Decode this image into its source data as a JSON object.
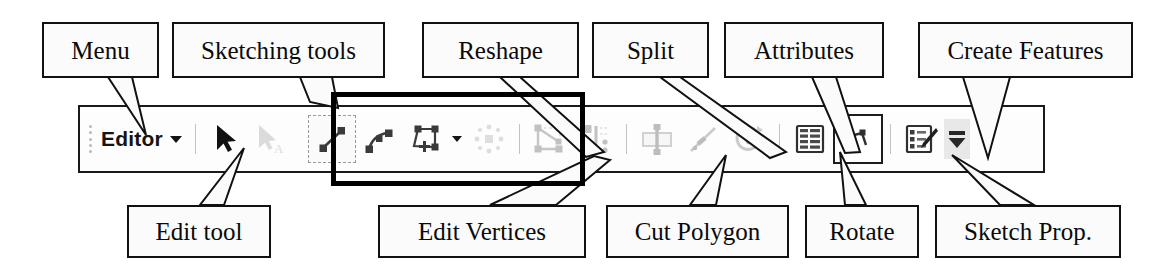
{
  "figure": {
    "annotation_style": "callout boxes with leader lines"
  },
  "callouts_top": [
    {
      "id": "menu",
      "label": "Menu",
      "x": 42,
      "y": 22,
      "w": 117,
      "h": 56,
      "font": 25
    },
    {
      "id": "sketching-tools",
      "label": "Sketching tools",
      "x": 172,
      "y": 22,
      "w": 213,
      "h": 56,
      "font": 25
    },
    {
      "id": "reshape",
      "label": "Reshape",
      "x": 422,
      "y": 22,
      "w": 157,
      "h": 56,
      "font": 25
    },
    {
      "id": "split",
      "label": "Split",
      "x": 592,
      "y": 22,
      "w": 117,
      "h": 56,
      "font": 25
    },
    {
      "id": "attributes",
      "label": "Attributes",
      "x": 724,
      "y": 22,
      "w": 160,
      "h": 56,
      "font": 25
    },
    {
      "id": "create-features",
      "label": "Create Features",
      "x": 918,
      "y": 22,
      "w": 215,
      "h": 56,
      "font": 25
    }
  ],
  "callouts_bottom": [
    {
      "id": "edit-tool",
      "label": "Edit tool",
      "x": 127,
      "y": 205,
      "w": 144,
      "h": 53,
      "font": 25
    },
    {
      "id": "edit-vertices",
      "label": "Edit Vertices",
      "x": 378,
      "y": 205,
      "w": 208,
      "h": 53,
      "font": 25
    },
    {
      "id": "cut-polygon",
      "label": "Cut Polygon",
      "x": 606,
      "y": 205,
      "w": 183,
      "h": 53,
      "font": 25
    },
    {
      "id": "rotate",
      "label": "Rotate",
      "x": 805,
      "y": 205,
      "w": 114,
      "h": 53,
      "font": 25
    },
    {
      "id": "sketch-prop",
      "label": "Sketch Prop.",
      "x": 935,
      "y": 205,
      "w": 186,
      "h": 53,
      "font": 25
    }
  ],
  "toolbar": {
    "menu_label": "Editor",
    "menu_has_dropdown": true,
    "items": [
      {
        "name": "edit-tool",
        "icon": "black-arrow-cursor",
        "state": "enabled"
      },
      {
        "name": "edit-annotation-tool",
        "icon": "arrow-cursor-with-A",
        "state": "disabled"
      },
      {
        "name": "straight-segment-tool",
        "icon": "straight-line-two-vertices",
        "state": "selected"
      },
      {
        "name": "end-point-arc-tool",
        "icon": "arc-two-vertices",
        "state": "enabled"
      },
      {
        "name": "trace-tool",
        "icon": "polygon-with-move-handle",
        "state": "enabled",
        "has_dropdown": true
      },
      {
        "name": "sketch-extra-tool",
        "icon": "radial-dots",
        "state": "disabled"
      },
      {
        "name": "reshape-feature-tool",
        "icon": "polygon-reshape",
        "state": "disabled"
      },
      {
        "name": "edit-vertices-tool",
        "icon": "vertices-bar",
        "state": "disabled"
      },
      {
        "name": "cut-polygon-tool",
        "icon": "rectangle-cut-line",
        "state": "disabled"
      },
      {
        "name": "split-tool",
        "icon": "diagonal-split-line",
        "state": "disabled"
      },
      {
        "name": "rotate-tool",
        "icon": "circular-rotate-arrow",
        "state": "disabled"
      },
      {
        "name": "attributes-button",
        "icon": "attribute-table",
        "state": "enabled"
      },
      {
        "name": "sketch-properties-button",
        "icon": "sketch-properties-square",
        "state": "enabled"
      },
      {
        "name": "create-features-button",
        "icon": "list-with-pencil",
        "state": "enabled"
      },
      {
        "name": "toolbar-overflow",
        "icon": "overflow-chevron-down",
        "state": "enabled"
      }
    ]
  },
  "group_highlight": {
    "name": "sketching-tools-group",
    "note": "thick black rectangle drawn around the sketching tool icons"
  }
}
